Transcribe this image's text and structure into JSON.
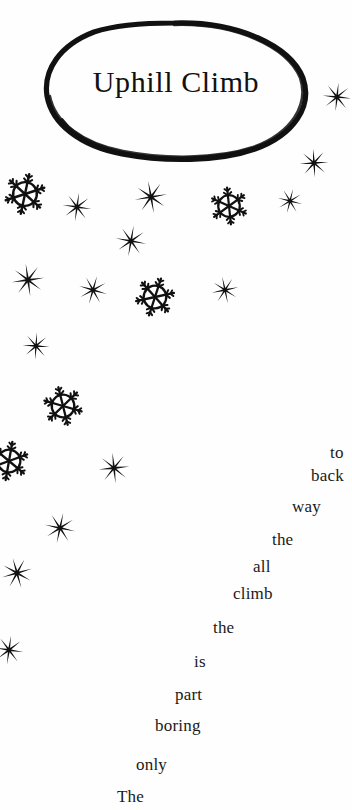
{
  "page": {
    "background_color": "#fefefe",
    "ink_color": "#111111",
    "width": 352,
    "height": 810
  },
  "title": {
    "text": "Uphill Climb",
    "bubble_shape": "hand-drawn-oval"
  },
  "poem": {
    "full_text": "The only boring part is the climb all the way back to",
    "reading_order": "bottom-to-top-ascending-right",
    "words": [
      {
        "text": "to",
        "x": 330,
        "y": 443,
        "clipped": true
      },
      {
        "text": "back",
        "x": 311,
        "y": 466,
        "clipped": true
      },
      {
        "text": "way",
        "x": 292,
        "y": 497,
        "clipped": false
      },
      {
        "text": "the",
        "x": 272,
        "y": 530,
        "clipped": false
      },
      {
        "text": "all",
        "x": 253,
        "y": 557,
        "clipped": false
      },
      {
        "text": "climb",
        "x": 233,
        "y": 584,
        "clipped": false
      },
      {
        "text": "the",
        "x": 213,
        "y": 618,
        "clipped": false
      },
      {
        "text": "is",
        "x": 194,
        "y": 652,
        "clipped": false
      },
      {
        "text": "part",
        "x": 175,
        "y": 685,
        "clipped": false
      },
      {
        "text": "boring",
        "x": 155,
        "y": 716,
        "clipped": false
      },
      {
        "text": "only",
        "x": 136,
        "y": 755,
        "clipped": false
      },
      {
        "text": "The",
        "x": 117,
        "y": 787,
        "clipped": false
      }
    ]
  },
  "snowflakes": [
    {
      "id": 1,
      "type": "crystal",
      "x": 3,
      "y": 172,
      "size": 44,
      "rotation": 12
    },
    {
      "id": 2,
      "type": "star",
      "x": 62,
      "y": 192,
      "size": 30,
      "rotation": 8
    },
    {
      "id": 3,
      "type": "star",
      "x": 134,
      "y": 180,
      "size": 34,
      "rotation": -10
    },
    {
      "id": 4,
      "type": "crystal",
      "x": 209,
      "y": 186,
      "size": 40,
      "rotation": -6
    },
    {
      "id": 5,
      "type": "star",
      "x": 277,
      "y": 188,
      "size": 26,
      "rotation": 14
    },
    {
      "id": 6,
      "type": "star",
      "x": 299,
      "y": 148,
      "size": 30,
      "rotation": -4
    },
    {
      "id": 7,
      "type": "star",
      "x": 322,
      "y": 82,
      "size": 30,
      "rotation": 6
    },
    {
      "id": 8,
      "type": "star",
      "x": 115,
      "y": 225,
      "size": 32,
      "rotation": 10
    },
    {
      "id": 9,
      "type": "star",
      "x": 11,
      "y": 263,
      "size": 34,
      "rotation": -8
    },
    {
      "id": 10,
      "type": "star",
      "x": 78,
      "y": 275,
      "size": 30,
      "rotation": 16
    },
    {
      "id": 11,
      "type": "crystal",
      "x": 134,
      "y": 276,
      "size": 42,
      "rotation": 18
    },
    {
      "id": 12,
      "type": "star",
      "x": 211,
      "y": 276,
      "size": 28,
      "rotation": -12
    },
    {
      "id": 13,
      "type": "star",
      "x": 22,
      "y": 332,
      "size": 28,
      "rotation": 4
    },
    {
      "id": 14,
      "type": "crystal",
      "x": 42,
      "y": 385,
      "size": 42,
      "rotation": -14
    },
    {
      "id": 15,
      "type": "crystal",
      "x": -12,
      "y": 440,
      "size": 42,
      "rotation": 10
    },
    {
      "id": 16,
      "type": "star",
      "x": 98,
      "y": 452,
      "size": 32,
      "rotation": -6
    },
    {
      "id": 17,
      "type": "star",
      "x": 44,
      "y": 512,
      "size": 32,
      "rotation": 12
    },
    {
      "id": 18,
      "type": "star",
      "x": 1,
      "y": 557,
      "size": 32,
      "rotation": -16
    },
    {
      "id": 19,
      "type": "star",
      "x": -6,
      "y": 635,
      "size": 30,
      "rotation": 8
    }
  ]
}
